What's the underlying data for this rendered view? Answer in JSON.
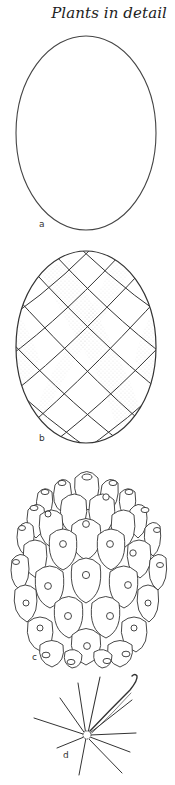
{
  "header": {
    "title": "Plants in detail"
  },
  "figures": [
    {
      "id": "a",
      "label": "a",
      "description": "outline-oval"
    },
    {
      "id": "b",
      "label": "b",
      "description": "oval-with-spiral-lattice-and-stippling"
    },
    {
      "id": "c",
      "label": "c",
      "description": "cone-of-tubercles-with-areoles"
    },
    {
      "id": "d",
      "label": "d",
      "description": "radiating-spine-cluster-with-hooked-central-spine"
    }
  ],
  "colors": {
    "ink": "#333333",
    "background": "#ffffff",
    "stipple": "#9a9a9a"
  }
}
